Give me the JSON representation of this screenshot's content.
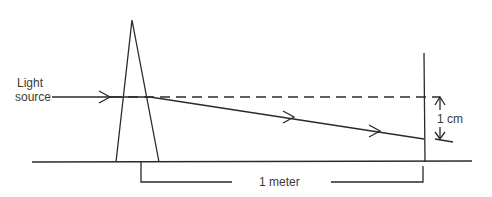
{
  "diagram": {
    "title": "",
    "labels": {
      "light_source_line1": "Light",
      "light_source_line2": "source",
      "deflection": "1 cm",
      "distance": "1 meter"
    },
    "components": [
      "light-source",
      "prism",
      "screen",
      "ground-line"
    ],
    "rays": [
      {
        "name": "incident-ray",
        "style": "solid"
      },
      {
        "name": "undeviated-path",
        "style": "dashed"
      },
      {
        "name": "refracted-ray",
        "style": "solid",
        "arrows": 2
      }
    ],
    "colors": {
      "ink": "#2a2a2a",
      "background": "#ffffff"
    }
  }
}
